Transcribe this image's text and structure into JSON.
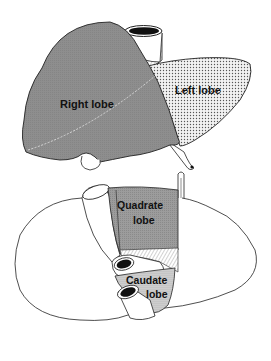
{
  "figure": {
    "upper_view": {
      "labels": {
        "right_lobe": "Right lobe",
        "left_lobe": "Left lobe"
      }
    },
    "lower_view": {
      "labels": {
        "quadrate_line1": "Quadrate",
        "quadrate_line2": "lobe",
        "caudate_line1": "Caudate",
        "caudate_line2": "lobe"
      }
    }
  },
  "colors": {
    "right_lobe_fill": "#8c8c8c",
    "left_lobe_fill": "#dcdcdc",
    "quadrate_fill": "#999999",
    "caudate_fill": "#cfcfcf",
    "outline": "#222222",
    "background": "#ffffff"
  }
}
